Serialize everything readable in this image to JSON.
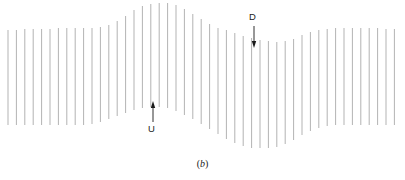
{
  "figure": {
    "caption_open": "(",
    "caption_letter": "b",
    "caption_close": ")",
    "caption_full": "(b)",
    "width": 405,
    "height": 180,
    "background_color": "#ffffff"
  },
  "annotations": {
    "up_marker": {
      "label": "U",
      "meaning": "upward-displacement-marker",
      "arrow_direction": "up",
      "label_x": 152,
      "label_y": 129,
      "arrow_x": 153,
      "arrow_tail_y": 122,
      "arrow_tip_y": 101,
      "color": "#1a1a1a"
    },
    "down_marker": {
      "label": "D",
      "meaning": "downward-displacement-marker",
      "arrow_direction": "down",
      "label_x": 253,
      "label_y": 17,
      "arrow_x": 254,
      "arrow_tail_y": 26,
      "arrow_tip_y": 48,
      "color": "#1a1a1a"
    }
  },
  "chart_data": {
    "type": "line",
    "title": "(b)",
    "subtitle": "",
    "xlabel": "",
    "ylabel": "",
    "grid": false,
    "legend": "none",
    "line_color": "#b3b3b3",
    "line_width": 1.0,
    "line_count": 47,
    "x_spacing": 8.4,
    "x_start": 8,
    "xlim": [
      0,
      405
    ],
    "ylim": [
      0,
      180
    ],
    "baseline_top": 29,
    "baseline_bottom": 125,
    "series": [
      {
        "name": "top-envelope",
        "x": [
          8,
          16.4,
          24.8,
          33.2,
          41.6,
          50,
          58.4,
          66.8,
          75.2,
          83.6,
          92,
          100.4,
          108.8,
          117.2,
          125.6,
          134,
          142.4,
          150.8,
          159.2,
          167.6,
          176,
          184.4,
          192.8,
          201.2,
          209.6,
          218,
          226.4,
          234.8,
          243.2,
          251.6,
          260,
          268.4,
          276.8,
          285.2,
          293.6,
          302,
          310.4,
          318.8,
          327.2,
          335.6,
          344,
          352.4,
          360.8,
          369.2,
          377.6,
          386,
          394.4
        ],
        "values": [
          30,
          30,
          29,
          29,
          29,
          29,
          28,
          28,
          28,
          28,
          28,
          27,
          25,
          21,
          16,
          10,
          6,
          4,
          3,
          3,
          5,
          9,
          14,
          19,
          24,
          28,
          30,
          33,
          36,
          38,
          40,
          41,
          42,
          41,
          39,
          35,
          32,
          30,
          29,
          28,
          28,
          28,
          28,
          28,
          28,
          29,
          29
        ]
      },
      {
        "name": "bottom-envelope",
        "x": [
          8,
          16.4,
          24.8,
          33.2,
          41.6,
          50,
          58.4,
          66.8,
          75.2,
          83.6,
          92,
          100.4,
          108.8,
          117.2,
          125.6,
          134,
          142.4,
          150.8,
          159.2,
          167.6,
          176,
          184.4,
          192.8,
          201.2,
          209.6,
          218,
          226.4,
          234.8,
          243.2,
          251.6,
          260,
          268.4,
          276.8,
          285.2,
          293.6,
          302,
          310.4,
          318.8,
          327.2,
          335.6,
          344,
          352.4,
          360.8,
          369.2,
          377.6,
          386,
          394.4
        ],
        "values": [
          125,
          125,
          125,
          125,
          125,
          125,
          125,
          125,
          125,
          125,
          124,
          122,
          119,
          116,
          113,
          110,
          108,
          107,
          107,
          108,
          111,
          115,
          119,
          124,
          129,
          134,
          139,
          143,
          146,
          148,
          148,
          148,
          147,
          144,
          140,
          135,
          131,
          128,
          126,
          125,
          125,
          125,
          125,
          125,
          125,
          125,
          125
        ]
      }
    ]
  }
}
